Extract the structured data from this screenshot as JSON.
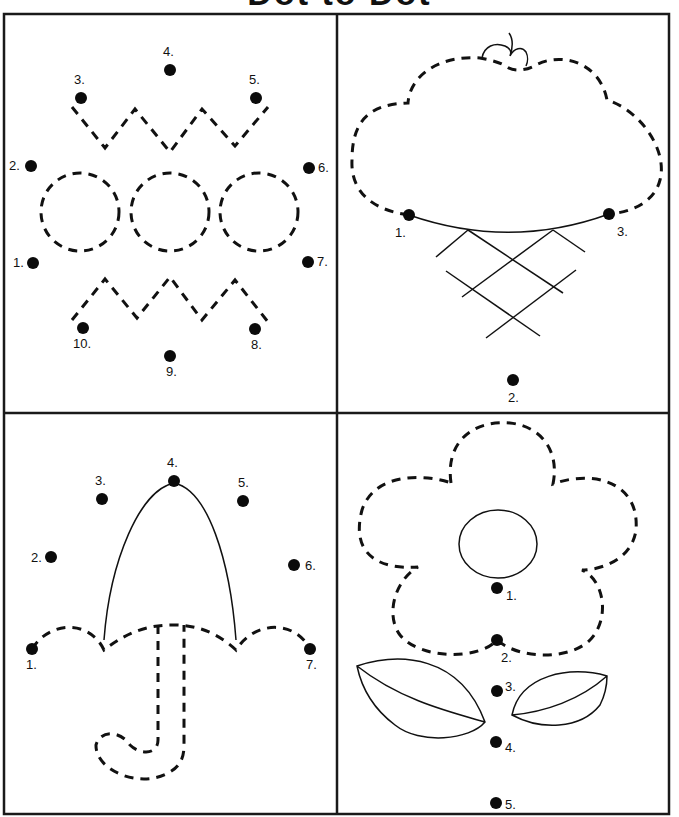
{
  "worksheet": {
    "title": "Dot to Dot",
    "panels": [
      {
        "id": "crown",
        "dots": [
          {
            "label": "1.",
            "x": 33,
            "y": 263
          },
          {
            "label": "2.",
            "x": 31,
            "y": 166
          },
          {
            "label": "3.",
            "x": 81,
            "y": 98
          },
          {
            "label": "4.",
            "x": 170,
            "y": 70
          },
          {
            "label": "5.",
            "x": 256,
            "y": 98
          },
          {
            "label": "6.",
            "x": 309,
            "y": 168
          },
          {
            "label": "7.",
            "x": 308,
            "y": 262
          },
          {
            "label": "8.",
            "x": 255,
            "y": 329
          },
          {
            "label": "9.",
            "x": 170,
            "y": 356
          },
          {
            "label": "10.",
            "x": 83,
            "y": 328
          }
        ]
      },
      {
        "id": "ice-cream",
        "dots": [
          {
            "label": "1.",
            "x": 409,
            "y": 215
          },
          {
            "label": "2.",
            "x": 513,
            "y": 380
          },
          {
            "label": "3.",
            "x": 609,
            "y": 214
          }
        ]
      },
      {
        "id": "umbrella",
        "dots": [
          {
            "label": "1.",
            "x": 32,
            "y": 649
          },
          {
            "label": "2.",
            "x": 51,
            "y": 557
          },
          {
            "label": "3.",
            "x": 102,
            "y": 499
          },
          {
            "label": "4.",
            "x": 174,
            "y": 481
          },
          {
            "label": "5.",
            "x": 243,
            "y": 501
          },
          {
            "label": "6.",
            "x": 294,
            "y": 565
          },
          {
            "label": "7.",
            "x": 310,
            "y": 649
          }
        ]
      },
      {
        "id": "flower",
        "dots": [
          {
            "label": "1.",
            "x": 497,
            "y": 588
          },
          {
            "label": "2.",
            "x": 497,
            "y": 640
          },
          {
            "label": "3.",
            "x": 497,
            "y": 691
          },
          {
            "label": "4.",
            "x": 496,
            "y": 742
          },
          {
            "label": "5.",
            "x": 496,
            "y": 803
          }
        ]
      }
    ]
  }
}
